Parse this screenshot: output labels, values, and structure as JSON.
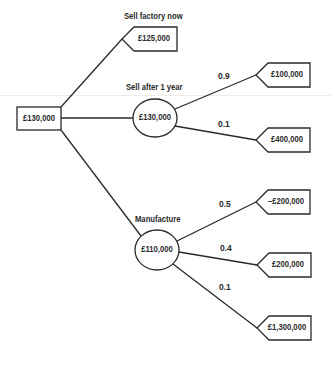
{
  "diagram": {
    "type": "decision-tree",
    "root": {
      "value": "£130,000",
      "kind": "decision"
    },
    "branches": [
      {
        "label": "Sell factory now",
        "terminal": "£125,000"
      },
      {
        "label": "Sell after 1 year",
        "chance_value": "£130,000",
        "outcomes": [
          {
            "prob": "0.9",
            "value": "£100,000"
          },
          {
            "prob": "0.1",
            "value": "£400,000"
          }
        ]
      },
      {
        "label": "Manufacture",
        "chance_value": "£110,000",
        "outcomes": [
          {
            "prob": "0.5",
            "value": "–£200,000"
          },
          {
            "prob": "0.4",
            "value": "£200,000"
          },
          {
            "prob": "0.1",
            "value": "£1,300,000"
          }
        ]
      }
    ]
  },
  "colors": {
    "stroke": "#2a2a2a",
    "background": "#ffffff"
  }
}
